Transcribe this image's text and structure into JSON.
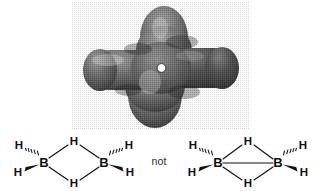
{
  "figure": {
    "background_color": "#ffffff",
    "not_label": "not"
  },
  "orbital": {
    "name": "diborane-electron-density-surface",
    "description": "Three-dimensional shaded cross-shaped electron density isosurface of diborane viewed down the B-B axis",
    "shape": "cross",
    "lobes": [
      {
        "position": "left",
        "shade": "#6e6e6e"
      },
      {
        "position": "right",
        "shade": "#4a4a4a"
      },
      {
        "position": "top",
        "shade": "#747474"
      },
      {
        "position": "bottom",
        "shade": "#7a7a7a"
      }
    ],
    "center_highlight_color": "#ffffff",
    "surface_base_color": "#5a5a5a",
    "highlight_color": "#b5b5b5",
    "shadow_color": "#2e2e2e"
  },
  "structures": [
    {
      "id": "correct-structure",
      "name": "diborane-bridged-no-bb-bond",
      "has_bb_bond": false,
      "atoms": {
        "boron_left": "B",
        "boron_right": "B",
        "terminal_h_upper_left": "H",
        "terminal_h_lower_left": "H",
        "terminal_h_upper_right": "H",
        "terminal_h_lower_right": "H",
        "bridging_h_top": "H",
        "bridging_h_bottom": "H"
      },
      "bonds": [
        {
          "from": "boron_left",
          "to": "terminal_h_upper_left",
          "style": "hashed-wedge"
        },
        {
          "from": "boron_left",
          "to": "terminal_h_lower_left",
          "style": "solid-wedge"
        },
        {
          "from": "boron_right",
          "to": "terminal_h_upper_right",
          "style": "hashed-wedge"
        },
        {
          "from": "boron_right",
          "to": "terminal_h_lower_right",
          "style": "solid-wedge"
        },
        {
          "from": "boron_left",
          "to": "bridging_h_top",
          "style": "plain-line"
        },
        {
          "from": "boron_right",
          "to": "bridging_h_top",
          "style": "plain-line"
        },
        {
          "from": "boron_left",
          "to": "bridging_h_bottom",
          "style": "plain-line"
        },
        {
          "from": "boron_right",
          "to": "bridging_h_bottom",
          "style": "plain-line"
        }
      ]
    },
    {
      "id": "incorrect-structure",
      "name": "diborane-bridged-with-bb-bond",
      "has_bb_bond": true,
      "atoms": {
        "boron_left": "B",
        "boron_right": "B",
        "terminal_h_upper_left": "H",
        "terminal_h_lower_left": "H",
        "terminal_h_upper_right": "H",
        "terminal_h_lower_right": "H",
        "bridging_h_top": "H",
        "bridging_h_bottom": "H"
      },
      "bonds": [
        {
          "from": "boron_left",
          "to": "terminal_h_upper_left",
          "style": "hashed-wedge"
        },
        {
          "from": "boron_left",
          "to": "terminal_h_lower_left",
          "style": "solid-wedge"
        },
        {
          "from": "boron_right",
          "to": "terminal_h_upper_right",
          "style": "hashed-wedge"
        },
        {
          "from": "boron_right",
          "to": "terminal_h_lower_right",
          "style": "solid-wedge"
        },
        {
          "from": "boron_left",
          "to": "bridging_h_top",
          "style": "plain-line"
        },
        {
          "from": "boron_right",
          "to": "bridging_h_top",
          "style": "plain-line"
        },
        {
          "from": "boron_left",
          "to": "bridging_h_bottom",
          "style": "plain-line"
        },
        {
          "from": "boron_right",
          "to": "bridging_h_bottom",
          "style": "plain-line"
        },
        {
          "from": "boron_left",
          "to": "boron_right",
          "style": "plain-line"
        }
      ]
    }
  ]
}
